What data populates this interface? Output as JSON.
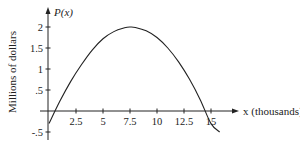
{
  "chart_data": {
    "type": "line",
    "title": "",
    "xlabel": "x (thousands)",
    "ylabel": "Millions of dollars",
    "y_axis_name": "P(x)",
    "x_ticks": [
      2.5,
      5,
      7.5,
      10,
      12.5,
      15
    ],
    "x_tick_labels": [
      "2.5",
      "5",
      "7.5",
      "10",
      "12.5",
      "15"
    ],
    "y_ticks": [
      -0.5,
      0.5,
      1,
      1.5,
      2
    ],
    "y_tick_labels": [
      "-.5",
      ".5",
      "1",
      "1.5",
      "2"
    ],
    "xlim": [
      0,
      16
    ],
    "ylim": [
      -0.6,
      2.2
    ],
    "grid": false,
    "legend": null,
    "series": [
      {
        "name": "P(x)",
        "description": "Downward-opening parabola, max about 2 near x = 7.5",
        "x": [
          0,
          1,
          2,
          3,
          4,
          5,
          6,
          7,
          7.5,
          8,
          9,
          10,
          11,
          12,
          13,
          14,
          15,
          15.8
        ],
        "y": [
          -0.3,
          0.23,
          0.7,
          1.1,
          1.45,
          1.72,
          1.89,
          1.98,
          2.0,
          1.99,
          1.91,
          1.75,
          1.5,
          1.17,
          0.76,
          0.27,
          -0.3,
          -0.5
        ]
      }
    ]
  },
  "labels": {
    "y_axis_name": "P(x)",
    "x_axis_name": "x (thousands)",
    "y_axis_title": "Millions of dollars"
  }
}
